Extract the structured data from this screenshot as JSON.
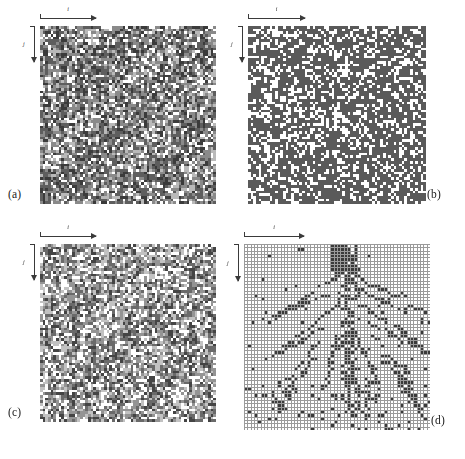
{
  "figure": {
    "background_color": "#ffffff",
    "layout": "2x2 panel grid of square lattice / cellular-automaton configurations"
  },
  "axes": {
    "horizontal_label": "i",
    "vertical_label": "j",
    "horizontal_arrow_direction": "right",
    "vertical_arrow_direction": "down"
  },
  "panels": [
    {
      "id": "a",
      "label": "(a)",
      "label_position": "bottom-left",
      "x": 40,
      "y": 26,
      "width": 176,
      "height": 178,
      "cols": 66,
      "rows": 66,
      "style": "multi-gray",
      "gridline": false,
      "palette": [
        "#ffffff",
        "#b9b9b9",
        "#8a8a8a",
        "#5e5e5e",
        "#3b3b3b"
      ],
      "weights": [
        0.16,
        0.17,
        0.24,
        0.26,
        0.17
      ],
      "seed": 10711,
      "description": "Dense lattice with several gray levels and scattered white sites, faint vertical streaks"
    },
    {
      "id": "b",
      "label": "(b)",
      "label_position": "bottom-right",
      "x": 248,
      "y": 26,
      "width": 178,
      "height": 178,
      "cols": 66,
      "rows": 66,
      "style": "two-tone",
      "gridline": false,
      "palette": [
        "#ffffff",
        "#5a5a5a"
      ],
      "weights": [
        0.33,
        0.67
      ],
      "seed": 24509,
      "description": "Binary dark-gray / white random lattice, uniform density"
    },
    {
      "id": "c",
      "label": "(c)",
      "label_position": "bottom-left",
      "x": 40,
      "y": 244,
      "width": 176,
      "height": 178,
      "cols": 66,
      "rows": 66,
      "style": "multi-gray",
      "gridline": false,
      "palette": [
        "#ffffff",
        "#c2c2c2",
        "#949494",
        "#6a6a6a",
        "#444444"
      ],
      "weights": [
        0.24,
        0.2,
        0.22,
        0.2,
        0.14
      ],
      "seed": 38217,
      "description": "Multi-gray lattice, lighter overall than (a), with a dark diagonal cluster upper-right"
    },
    {
      "id": "d",
      "label": "(d)",
      "label_position": "bottom-right",
      "x": 244,
      "y": 244,
      "width": 186,
      "height": 186,
      "cols": 56,
      "rows": 56,
      "style": "sparse-black",
      "gridline": true,
      "gridline_color": "#9a9a9a",
      "palette": [
        "#ffffff",
        "#3a3a3a"
      ],
      "seed": 51903,
      "description": "Sparse black cells on white ruled grid forming a branching tree-like backbone with a dense trunk at top-centre"
    }
  ]
}
